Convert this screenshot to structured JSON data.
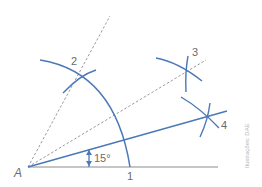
{
  "diagram": {
    "type": "geometric-construction",
    "colors": {
      "construction_blue": "#4a78b8",
      "base_line": "#8c8c8c",
      "dashed": "#9a9a9a",
      "label": "#6b6b6b",
      "credit": "#b5b5b5"
    },
    "points": [
      {
        "id": "A",
        "label": "A",
        "x": 28,
        "y": 167
      },
      {
        "id": "1",
        "label": "1",
        "x": 130,
        "y": 167
      },
      {
        "id": "2",
        "label": "2",
        "x": 79,
        "y": 76
      },
      {
        "id": "3",
        "label": "3",
        "x": 187,
        "y": 70
      },
      {
        "id": "4",
        "label": "4",
        "x": 208,
        "y": 117
      }
    ],
    "angle_label": "15°",
    "credit": "Ilustrações: DAE"
  }
}
